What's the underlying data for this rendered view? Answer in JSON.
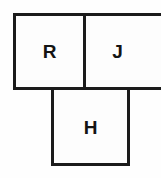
{
  "diagram": {
    "type": "lettered-square-grid",
    "shape_name": "T-shape",
    "canvas": {
      "width_px": 161,
      "height_px": 178,
      "background_color": "#fefefe"
    },
    "style": {
      "stroke_color": "#1b1b1b",
      "stroke_width_px": 3,
      "fill_color": "#fdfdfd",
      "label_color": "#141414"
    },
    "cells": [
      {
        "id": "r",
        "label": "R",
        "row": 0,
        "column": 0,
        "clipped": false
      },
      {
        "id": "j",
        "label": "J",
        "row": 0,
        "column": 1,
        "clipped": true
      },
      {
        "id": "h",
        "label": "H",
        "row": 1,
        "column": 0,
        "clipped": false
      }
    ]
  }
}
